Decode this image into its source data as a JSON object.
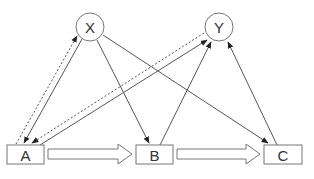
{
  "diagram": {
    "type": "causal-path-diagram",
    "nodes": [
      {
        "id": "X",
        "label": "X",
        "shape": "circle"
      },
      {
        "id": "Y",
        "label": "Y",
        "shape": "circle"
      },
      {
        "id": "A",
        "label": "A",
        "shape": "rectangle"
      },
      {
        "id": "B",
        "label": "B",
        "shape": "rectangle"
      },
      {
        "id": "C",
        "label": "C",
        "shape": "rectangle"
      }
    ],
    "edges": [
      {
        "from": "X",
        "to": "A",
        "style": "solid"
      },
      {
        "from": "A",
        "to": "X",
        "style": "dashed"
      },
      {
        "from": "X",
        "to": "B",
        "style": "solid"
      },
      {
        "from": "X",
        "to": "C",
        "style": "solid"
      },
      {
        "from": "A",
        "to": "Y",
        "style": "solid"
      },
      {
        "from": "Y",
        "to": "A",
        "style": "dashed"
      },
      {
        "from": "B",
        "to": "Y",
        "style": "solid"
      },
      {
        "from": "C",
        "to": "Y",
        "style": "solid"
      }
    ],
    "block_arrows": [
      {
        "from": "A",
        "to": "B"
      },
      {
        "from": "B",
        "to": "C"
      }
    ],
    "colors": {
      "line": "#555555",
      "node_border": "#777777",
      "text": "#333333",
      "background": "#ffffff"
    }
  }
}
